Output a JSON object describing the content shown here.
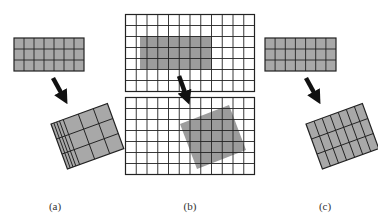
{
  "figure": {
    "colors": {
      "cell_fill": "#a8a8a8",
      "overlay_fill": "#9c9c9c",
      "line": "#222222",
      "arrow": "#111111",
      "background": "#ffffff"
    },
    "panels": [
      {
        "id": "a",
        "label": "(a)",
        "source_grid": {
          "cols": 7,
          "rows": 3
        },
        "result": "rotated grid with non-uniform column widths (4 compressed + 3 wide columns)"
      },
      {
        "id": "b",
        "label": "(b)",
        "top_grid": {
          "cols": 12,
          "rows": 7,
          "highlight": "axis-aligned grey rectangle"
        },
        "bottom_grid": {
          "cols": 12,
          "rows": 7,
          "highlight": "rotated grey square"
        }
      },
      {
        "id": "c",
        "label": "(c)",
        "source_grid": {
          "cols": 7,
          "rows": 3
        },
        "result": "rotated grid with uniform tall narrow cells"
      }
    ]
  }
}
